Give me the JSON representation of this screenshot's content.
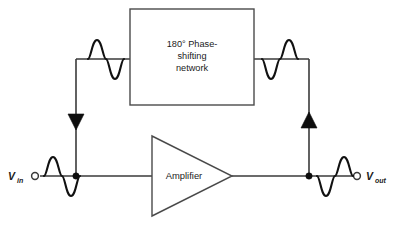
{
  "diagram": {
    "background_color": "#ffffff",
    "line_color": "#3a3a3a",
    "fill_color": "#0d0d0d",
    "width": 393,
    "height": 230
  },
  "phase_network": {
    "label_line1": "180° Phase-",
    "label_line2": "shifting",
    "label_line3": "network"
  },
  "amplifier": {
    "label": "Amplifier"
  },
  "terminals": {
    "input": {
      "symbol": "V",
      "subscript": "in"
    },
    "output": {
      "symbol": "V",
      "subscript": "out"
    }
  },
  "waveforms": {
    "input": {
      "name": "input-sine-wave",
      "phase": "positive-first"
    },
    "feedback_left": {
      "name": "feedback-left-sine-wave",
      "phase": "positive-first"
    },
    "feedback_right": {
      "name": "feedback-right-sine-wave",
      "phase": "negative-first"
    },
    "output": {
      "name": "output-sine-wave",
      "phase": "negative-first"
    }
  },
  "signal_arrows": {
    "left": {
      "name": "feedback-arrow-down",
      "direction": "down"
    },
    "right": {
      "name": "feedback-arrow-up",
      "direction": "up"
    }
  }
}
